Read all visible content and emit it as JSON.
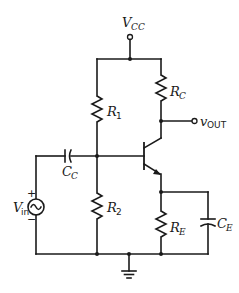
{
  "diagram": {
    "type": "common-emitter BJT amplifier schematic",
    "supply": {
      "label": "V",
      "sub": "CC"
    },
    "output": {
      "label": "v",
      "sub": "OUT"
    },
    "source": {
      "label": "V",
      "sub": "in",
      "plus": "+",
      "minus": "−"
    },
    "components": {
      "R1": {
        "label": "R",
        "sub": "1"
      },
      "R2": {
        "label": "R",
        "sub": "2"
      },
      "RC": {
        "label": "R",
        "sub": "C"
      },
      "RE": {
        "label": "R",
        "sub": "E"
      },
      "CC": {
        "label": "C",
        "sub": "C"
      },
      "CE": {
        "label": "C",
        "sub": "E"
      }
    },
    "transistor": "NPN",
    "colors": {
      "ink": "#1a1a1a",
      "background": "#ffffff"
    }
  }
}
